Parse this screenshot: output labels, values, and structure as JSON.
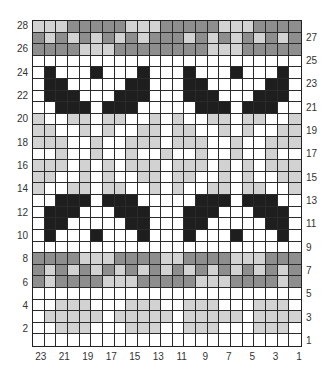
{
  "chart": {
    "title": "",
    "columns": 23,
    "rows": 28,
    "colors": {
      "W": "#ffffff",
      "L": "#d2d2d2",
      "M": "#b4b4b4",
      "D": "#8e8e8e",
      "B": "#1e1e1e"
    },
    "legend_note": "Rows listed top (28) to bottom (1); columns left (stitch 23) to right (stitch 1)",
    "grid": [
      "LLLDDDDDLLLDDDDDLLLDDDD",
      "DLDLDLDLDLDDDLDLDLDLDLD",
      "DDDDLLLDDDDDDDDLLLDDDDD",
      "WWWWWWWWWWWWWWWWWWWWWWW",
      "WBWWWBWWWBWWWBWWWBWWWBW",
      "WBBWWWWWBBWWWBBWWWWWBBW",
      "WBBBWWWBBBWWWBBBWWWBBBW",
      "WWBBBWBBBWWWWWBBBWBBBWW",
      "LWWLLWLLWWLWLWWLLWLLWWL",
      "LLWWLWLWWLLWLLWWLWLWWLL",
      "LLLWWLWWLLLWLLLWWLWWLLL",
      "WWLWWLWWLWWLWWLWWLWWLWW",
      "LLLWLWLWLLLWLLLWLWLWLLL",
      "LLWWLWLWWLLWLLWWLWLWWLL",
      "LWWLLWLLWWLWLWWLLWLLWWL",
      "WWBBBWBBBWWWWWBBBWBBBWW",
      "WBBBWWWBBBWWWBBBWWWBBBW",
      "WBBWWWWWBBWWWBBWWWWWBBW",
      "WBWWWBWWWBWWWBWWWBWWWBW",
      "WWWWWWWWWWWWWWWWWWWWWWW",
      "DDDDLLLDDDDLLDDDDLLLDDD",
      "DLDLDLDLDLDLDLDLDLDLDLD",
      "DLDDDDLLLDDDDDLLLDDDDLD",
      "WWWWWWWWWWWWWWWWWWWWWWW",
      "WWLLLWWWLLLWWLLLWWWLLLW",
      "WLLLLLWLLLLLWLLLLLWLLLL",
      "WWLLLWWWLLLWWLLLWWWLLLW",
      "WWWWWWWWWWWWWWWWWWWWWWW"
    ],
    "left_row_labels": [
      {
        "label": "28",
        "row": 28
      },
      {
        "label": "26",
        "row": 26
      },
      {
        "label": "24",
        "row": 24
      },
      {
        "label": "22",
        "row": 22
      },
      {
        "label": "20",
        "row": 20
      },
      {
        "label": "18",
        "row": 18
      },
      {
        "label": "16",
        "row": 16
      },
      {
        "label": "14",
        "row": 14
      },
      {
        "label": "12",
        "row": 12
      },
      {
        "label": "10",
        "row": 10
      },
      {
        "label": "8",
        "row": 8
      },
      {
        "label": "6",
        "row": 6
      },
      {
        "label": "4",
        "row": 4
      },
      {
        "label": "2",
        "row": 2
      }
    ],
    "right_row_labels": [
      {
        "label": "27",
        "row": 27
      },
      {
        "label": "25",
        "row": 25
      },
      {
        "label": "23",
        "row": 23
      },
      {
        "label": "21",
        "row": 21
      },
      {
        "label": "19",
        "row": 19
      },
      {
        "label": "17",
        "row": 17
      },
      {
        "label": "15",
        "row": 15
      },
      {
        "label": "13",
        "row": 13
      },
      {
        "label": "11",
        "row": 11
      },
      {
        "label": "9",
        "row": 9
      },
      {
        "label": "7",
        "row": 7
      },
      {
        "label": "5",
        "row": 5
      },
      {
        "label": "3",
        "row": 3
      },
      {
        "label": "1",
        "row": 1
      }
    ],
    "column_labels": [
      {
        "label": "23",
        "col": 23
      },
      {
        "label": "21",
        "col": 21
      },
      {
        "label": "19",
        "col": 19
      },
      {
        "label": "17",
        "col": 17
      },
      {
        "label": "15",
        "col": 15
      },
      {
        "label": "13",
        "col": 13
      },
      {
        "label": "11",
        "col": 11
      },
      {
        "label": "9",
        "col": 9
      },
      {
        "label": "7",
        "col": 7
      },
      {
        "label": "5",
        "col": 5
      },
      {
        "label": "3",
        "col": 3
      },
      {
        "label": "1",
        "col": 1
      }
    ]
  }
}
